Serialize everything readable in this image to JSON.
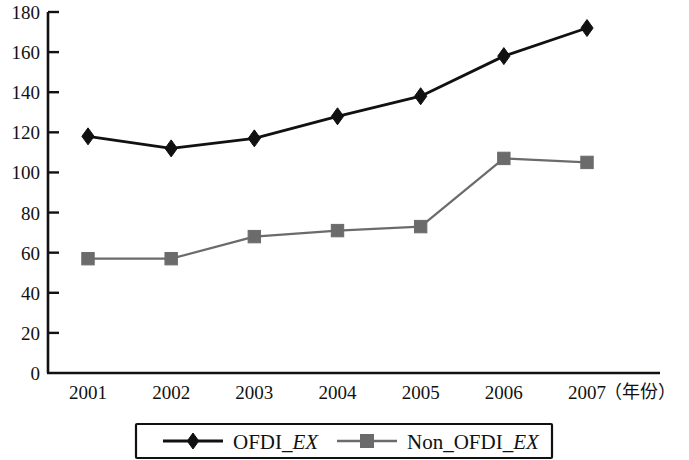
{
  "chart_data": {
    "type": "line",
    "title": "",
    "subtitle": "",
    "xlabel": "（年份）",
    "ylabel": "",
    "x": [
      "2001",
      "2002",
      "2003",
      "2004",
      "2005",
      "2006",
      "2007"
    ],
    "categories": [
      "2001",
      "2002",
      "2003",
      "2004",
      "2005",
      "2006",
      "2007"
    ],
    "xlim": [
      2001,
      2007
    ],
    "ylim": [
      0,
      180
    ],
    "yticks": [
      0,
      20,
      40,
      60,
      80,
      100,
      120,
      140,
      160,
      180
    ],
    "ytick_labels": [
      "0",
      "20",
      "40",
      "60",
      "80",
      "100",
      "120",
      "140",
      "160",
      "180"
    ],
    "grid": false,
    "legend_position": "bottom",
    "series": [
      {
        "name": "OFDI_EX",
        "name_prefix": "OFDI_",
        "name_italic": "EX",
        "marker": "diamond",
        "color": "#111111",
        "values": [
          118,
          112,
          117,
          128,
          138,
          158,
          172
        ]
      },
      {
        "name": "Non_OFDI_EX",
        "name_prefix": "Non_OFDI_",
        "name_italic": "EX",
        "marker": "square",
        "color": "#6b6b6b",
        "values": [
          57,
          57,
          68,
          71,
          73,
          107,
          105
        ]
      }
    ],
    "annotations": []
  },
  "legend": {
    "items": [
      {
        "prefix": "OFDI_",
        "italic": "EX",
        "marker": "diamond",
        "color": "#111111"
      },
      {
        "prefix": "Non_OFDI_",
        "italic": "EX",
        "marker": "square",
        "color": "#6b6b6b"
      }
    ]
  }
}
